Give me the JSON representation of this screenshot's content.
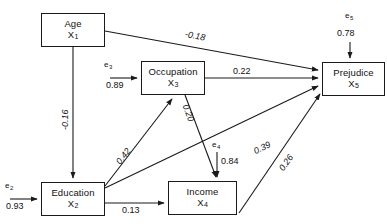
{
  "diagram": {
    "type": "path-diagram",
    "stroke_color": "#1a1a1a",
    "background": "#ffffff"
  },
  "nodes": [
    {
      "id": "age",
      "name": "Age",
      "var": "X",
      "sub": "1",
      "x": 41,
      "y": 13,
      "w": 64,
      "h": 34
    },
    {
      "id": "occupation",
      "name": "Occupation",
      "var": "X",
      "sub": "3",
      "x": 141,
      "y": 61,
      "w": 64,
      "h": 34
    },
    {
      "id": "prejudice",
      "name": "Prejudice",
      "var": "X",
      "sub": "5",
      "x": 322,
      "y": 62,
      "w": 63,
      "h": 34
    },
    {
      "id": "education",
      "name": "Education",
      "var": "X",
      "sub": "2",
      "x": 41,
      "y": 182,
      "w": 64,
      "h": 34
    },
    {
      "id": "income",
      "name": "Income",
      "var": "X",
      "sub": "4",
      "x": 168,
      "y": 181,
      "w": 69,
      "h": 34
    }
  ],
  "errors": [
    {
      "id": "e2",
      "label": "e",
      "sub": "2",
      "coefficient": "0.93",
      "target": "education"
    },
    {
      "id": "e3",
      "label": "e",
      "sub": "3",
      "coefficient": "0.89",
      "target": "occupation"
    },
    {
      "id": "e4",
      "label": "e",
      "sub": "4",
      "coefficient": "0.84",
      "target": "income"
    },
    {
      "id": "e5",
      "label": "e",
      "sub": "5",
      "coefficient": "0.78",
      "target": "prejudice"
    }
  ],
  "paths": [
    {
      "id": "age-prejudice",
      "from": "age",
      "to": "prejudice",
      "coefficient": "-0.18"
    },
    {
      "id": "age-education",
      "from": "age",
      "to": "education",
      "coefficient": "-0.16"
    },
    {
      "id": "occupation-prejudice",
      "from": "occupation",
      "to": "prejudice",
      "coefficient": "0.22"
    },
    {
      "id": "education-occupation",
      "from": "education",
      "to": "occupation",
      "coefficient": "0.42"
    },
    {
      "id": "occupation-income",
      "from": "occupation",
      "to": "income",
      "coefficient": "0.20"
    },
    {
      "id": "education-prejudice",
      "from": "education",
      "to": "prejudice",
      "coefficient": "0.39"
    },
    {
      "id": "education-income",
      "from": "education",
      "to": "income",
      "coefficient": "0.13"
    },
    {
      "id": "income-prejudice",
      "from": "income",
      "to": "prejudice",
      "coefficient": "0.26"
    }
  ]
}
